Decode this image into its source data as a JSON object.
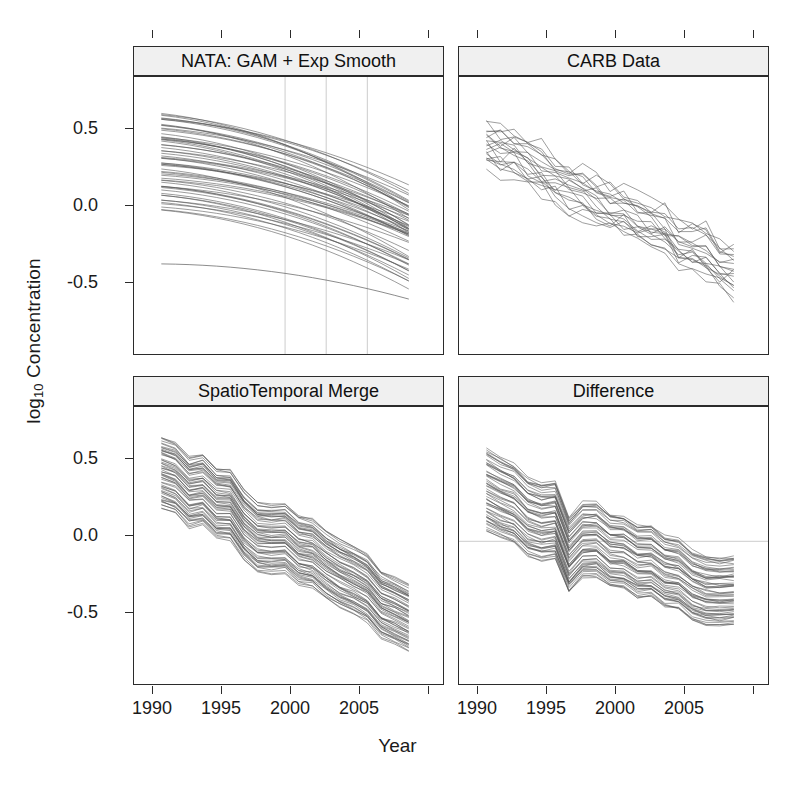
{
  "figure": {
    "xlabel": "Year",
    "ylabel_main": "log",
    "ylabel_sub": "10",
    "ylabel_rest": " Concentration"
  },
  "chart_data": {
    "type": "line",
    "title": "",
    "xlabel": "Year",
    "ylabel": "log10 Concentration",
    "xlim": [
      1989,
      2009.5
    ],
    "ylim": [
      -0.82,
      0.78
    ],
    "yticks": [
      0.5,
      0.0,
      -0.5
    ],
    "ytick_labels": [
      "0.5",
      "0.0",
      "-0.5"
    ],
    "xticks": [
      1990,
      1995,
      2000,
      2005,
      2010
    ],
    "xtick_labels": [
      "1990",
      "1995",
      "2000",
      "2005",
      ""
    ],
    "grid": "vertical gridlines only in panel 1 at 1999, 2002, 2005",
    "legend": "none",
    "layout": "2x2 trellis",
    "panels": [
      {
        "id": "nata",
        "label": "NATA: GAM + Exp Smooth",
        "row": 0,
        "col": 0,
        "description": "Smooth monotone GAM + exponential smoothing curves, ~60 sites, slowly declining then steepening after 2000",
        "vgrid_years": [
          1999,
          2002,
          2005
        ],
        "hline": null,
        "x": [
          1990,
          1991,
          1992,
          1993,
          1994,
          1995,
          1996,
          1997,
          1998,
          1999,
          2000,
          2001,
          2002,
          2003,
          2004,
          2005,
          2006,
          2007,
          2008
        ],
        "series_count": 60,
        "band_top_start": 0.62,
        "band_top_end": 0.2,
        "band_bottom_start": 0.0,
        "band_bottom_end": -0.38,
        "outlier_low_start": -0.33,
        "outlier_low_end": -0.48
      },
      {
        "id": "carb",
        "label": "CARB Data",
        "row": 0,
        "col": 1,
        "description": "Observed monitor data, ~20 sites, jagged year-to-year variability, steady decline",
        "vgrid_years": [],
        "hline": null,
        "x": [
          1990,
          1991,
          1992,
          1993,
          1994,
          1995,
          1996,
          1997,
          1998,
          1999,
          2000,
          2001,
          2002,
          2003,
          2004,
          2005,
          2006,
          2007,
          2008
        ],
        "series_count": 20,
        "band_top_start": 0.55,
        "band_top_end": -0.22,
        "band_bottom_start": 0.3,
        "band_bottom_end": -0.52
      },
      {
        "id": "merge",
        "label": "SpatioTemporal Merge",
        "row": 1,
        "col": 0,
        "description": "Merged spatiotemporal estimates, ~60 sites, coherent tight band with shared year-to-year wiggles",
        "vgrid_years": [],
        "hline": null,
        "x": [
          1990,
          1991,
          1992,
          1993,
          1994,
          1995,
          1996,
          1997,
          1998,
          1999,
          2000,
          2001,
          2002,
          2003,
          2004,
          2005,
          2006,
          2007,
          2008
        ],
        "series_count": 60,
        "band_top_start": 0.66,
        "band_top_end": -0.27,
        "band_bottom_start": 0.22,
        "band_bottom_end": -0.68
      },
      {
        "id": "difference",
        "label": "Difference",
        "row": 1,
        "col": 1,
        "description": "Merge minus NATA difference, ~60 sites, large drop around 1996, settling near -0.3",
        "vgrid_years": [],
        "hline": 0.0,
        "x": [
          1990,
          1991,
          1992,
          1993,
          1994,
          1995,
          1996,
          1997,
          1998,
          1999,
          2000,
          2001,
          2002,
          2003,
          2004,
          2005,
          2006,
          2007,
          2008
        ],
        "series_count": 60,
        "band_top_start": 0.62,
        "band_top_end": -0.12,
        "band_bottom_start": 0.1,
        "band_bottom_end": -0.55
      }
    ]
  },
  "ticks": {
    "y_labels": [
      "0.5",
      "0.0",
      "-0.5"
    ],
    "x_labels": [
      "1990",
      "1995",
      "2000",
      "2005"
    ]
  },
  "colors": {
    "line": "#555555",
    "axis": "#2b2b2b",
    "strip_bg": "#f0f0f0",
    "grid": "#cccccc",
    "background": "#ffffff"
  }
}
